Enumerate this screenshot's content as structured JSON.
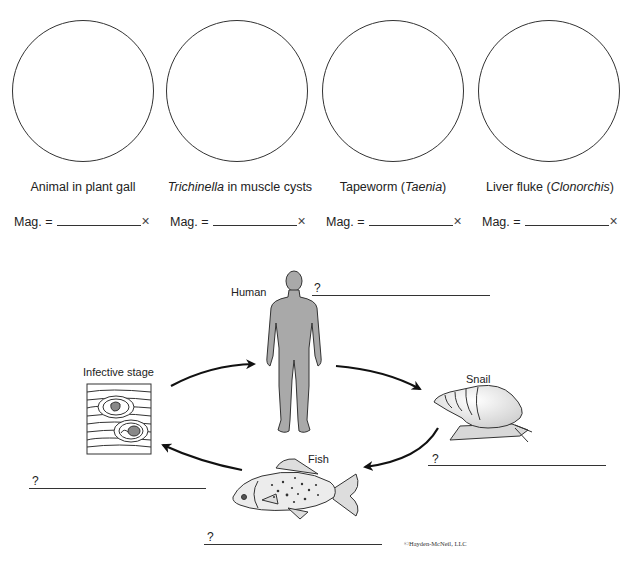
{
  "specimens": [
    {
      "caption_pre": "Animal in plant gall",
      "caption_italic": "",
      "caption_post": "",
      "mag_label": "Mag. =",
      "mag_value": "",
      "mag_suffix": "×"
    },
    {
      "caption_pre": "",
      "caption_italic": "Trichinella",
      "caption_post": " in muscle cysts",
      "mag_label": "Mag. =",
      "mag_value": "",
      "mag_suffix": "×"
    },
    {
      "caption_pre": "Tapeworm (",
      "caption_italic": "Taenia",
      "caption_post": ")",
      "mag_label": "Mag. =",
      "mag_value": "",
      "mag_suffix": "×"
    },
    {
      "caption_pre": "Liver fluke (",
      "caption_italic": "Clonorchis",
      "caption_post": ")",
      "mag_label": "Mag. =",
      "mag_value": "",
      "mag_suffix": "×"
    }
  ],
  "life_cycle": {
    "hosts": {
      "human": "Human",
      "snail": "Snail",
      "fish": "Fish",
      "infective": "Infective stage"
    },
    "blanks": {
      "human_q": "?",
      "snail_q": "?",
      "fish_q": "?",
      "infective_q": "?"
    },
    "colors": {
      "silhouette": "#a9a9a9",
      "stroke": "#222222",
      "shell": "#e4e4e4"
    }
  },
  "copyright": "©Hayden-McNeil, LLC"
}
